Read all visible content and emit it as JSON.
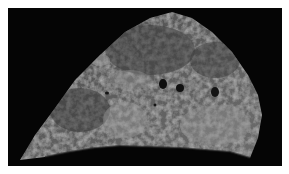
{
  "image": {
    "subject": "gross tissue specimen (lung section) on black background",
    "colors": {
      "page_background": "#ffffff",
      "photo_background": "#050505",
      "tissue_dark": "#3a3a3a",
      "tissue_mid": "#6a6a6a",
      "tissue_light": "#a8a8a8"
    }
  }
}
